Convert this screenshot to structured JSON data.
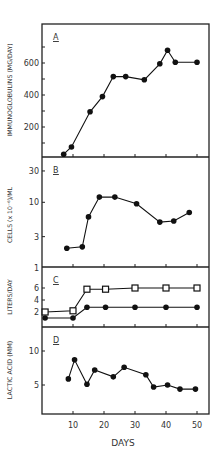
{
  "figure": {
    "xlabel": "DAYS",
    "x_ticks": [
      10,
      20,
      30,
      40,
      50
    ],
    "x_tick_labels": [
      "10",
      "20",
      "30",
      "40",
      "50"
    ]
  },
  "chart_data": [
    {
      "type": "line",
      "panel": "A",
      "title": "",
      "panel_label": "A",
      "xlabel": "DAYS",
      "ylabel": "IMMUNOGLOBULINS (MG/DAY)",
      "y_scale": "linear",
      "ylim": [
        0,
        820
      ],
      "y_ticks": [
        100,
        200,
        300,
        400,
        500,
        600,
        700
      ],
      "y_tick_labels": [
        "200",
        "400",
        "600"
      ],
      "y_tick_label_values": [
        200,
        400,
        600
      ],
      "grid": false,
      "series": [
        {
          "name": "Immunoglobulins",
          "marker": "filled-circle",
          "x": [
            7,
            9.5,
            15.5,
            19.5,
            23,
            27,
            33,
            38,
            40.5,
            43,
            50
          ],
          "values": [
            30,
            75,
            295,
            390,
            515,
            515,
            495,
            595,
            680,
            605,
            605
          ]
        }
      ]
    },
    {
      "type": "line",
      "panel": "B",
      "panel_label": "B",
      "xlabel": "DAYS",
      "ylabel": "CELLS (x 10^-6)/ML",
      "y_scale": "log",
      "ylim": [
        1,
        40
      ],
      "y_tick_labels": [
        "1",
        "3",
        "10",
        "30"
      ],
      "y_tick_label_values": [
        1,
        3,
        10,
        30
      ],
      "grid": false,
      "series": [
        {
          "name": "Cells",
          "marker": "filled-circle",
          "x": [
            8,
            13,
            15,
            18.5,
            23.5,
            30.5,
            38,
            42.5,
            47.5
          ],
          "values": [
            2.0,
            2.1,
            6.0,
            12.0,
            12.0,
            9.5,
            5.0,
            5.2,
            7.0
          ]
        }
      ]
    },
    {
      "type": "line",
      "panel": "C",
      "panel_label": "C",
      "xlabel": "DAYS",
      "ylabel": "LITERS/DAY",
      "y_scale": "linear",
      "ylim": [
        0,
        9
      ],
      "y_tick_labels": [
        "2",
        "4",
        "6"
      ],
      "y_tick_label_values": [
        2,
        4,
        6
      ],
      "grid": false,
      "series": [
        {
          "name": "Open squares",
          "marker": "open-square",
          "x": [
            1,
            10,
            14.5,
            20.5,
            30,
            40,
            50
          ],
          "values": [
            2.0,
            2.2,
            5.8,
            5.8,
            6.0,
            6.0,
            6.0
          ]
        },
        {
          "name": "Filled circles",
          "marker": "filled-circle",
          "x": [
            1,
            10,
            14.5,
            20.5,
            30,
            40,
            50
          ],
          "values": [
            1.0,
            1.0,
            2.8,
            2.8,
            2.8,
            2.8,
            2.8
          ]
        }
      ]
    },
    {
      "type": "line",
      "panel": "D",
      "panel_label": "D",
      "xlabel": "DAYS",
      "ylabel": "LACTIC ACID (MM)",
      "y_scale": "linear",
      "ylim": [
        0,
        13
      ],
      "y_tick_labels": [
        "5",
        "10"
      ],
      "y_tick_label_values": [
        5,
        10
      ],
      "grid": false,
      "series": [
        {
          "name": "Lactic acid",
          "marker": "filled-circle",
          "x": [
            8.5,
            10.5,
            14.5,
            17,
            23,
            26.5,
            33.5,
            36,
            40.5,
            44.5,
            49.5
          ],
          "values": [
            5.9,
            8.7,
            5.1,
            7.2,
            6.2,
            7.6,
            6.5,
            4.7,
            5.0,
            4.4,
            4.4
          ]
        }
      ]
    }
  ]
}
